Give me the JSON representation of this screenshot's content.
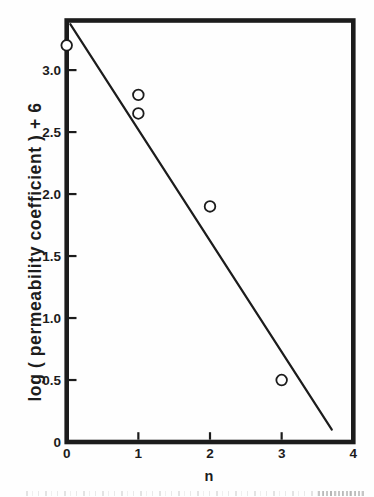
{
  "figure": {
    "background": "#fefefe",
    "ink_color": "#1c1c1c"
  },
  "chart_data": {
    "type": "scatter",
    "title": "",
    "xlabel": "n",
    "ylabel": "log ( permeability coefficient ) + 6",
    "xlim": [
      0,
      4
    ],
    "ylim": [
      0,
      3.4
    ],
    "grid": false,
    "legend": "none",
    "marker": "open-circle",
    "points": [
      {
        "x": 0,
        "y": 3.2
      },
      {
        "x": 1,
        "y": 2.8
      },
      {
        "x": 1,
        "y": 2.65
      },
      {
        "x": 2,
        "y": 1.9
      },
      {
        "x": 3,
        "y": 0.5
      }
    ],
    "fit_line": {
      "x_start": 0.05,
      "y_start": 3.37,
      "x_end": 3.7,
      "y_end": 0.1
    },
    "x_ticks": [
      {
        "value": 0,
        "label": "0",
        "mark": false
      },
      {
        "value": 1,
        "label": "1",
        "mark": true
      },
      {
        "value": 2,
        "label": "2",
        "mark": true
      },
      {
        "value": 3,
        "label": "3",
        "mark": true
      },
      {
        "value": 4,
        "label": "4",
        "mark": false
      }
    ],
    "y_ticks": [
      {
        "value": 0,
        "label": "0",
        "mark": false
      },
      {
        "value": 0.5,
        "label": "0.5",
        "mark": true
      },
      {
        "value": 1,
        "label": "1.0",
        "mark": true
      },
      {
        "value": 1.5,
        "label": "1.5",
        "mark": true
      },
      {
        "value": 2,
        "label": "2.0",
        "mark": true
      },
      {
        "value": 2.5,
        "label": "2.5",
        "mark": true
      },
      {
        "value": 3,
        "label": "3.0",
        "mark": true
      }
    ]
  }
}
